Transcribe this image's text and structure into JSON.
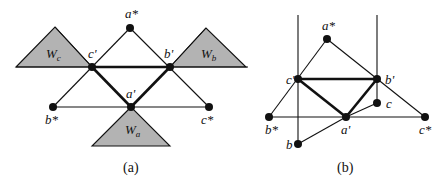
{
  "panel_a": {
    "caption": "(a)",
    "labels": {
      "a_star": "a*",
      "b_prime": "b'",
      "c_prime": "c'",
      "a_prime": "a'",
      "b_star": "b*",
      "c_star": "c*",
      "W_a": "W",
      "W_a_sub": "a",
      "W_b": "W",
      "W_b_sub": "b",
      "W_c": "W",
      "W_c_sub": "c"
    }
  },
  "panel_b": {
    "caption": "(b)",
    "labels": {
      "a_star": "a*",
      "b_prime": "b'",
      "c_prime": "c'",
      "a_prime": "a'",
      "b_star": "b*",
      "c_star": "c*",
      "b": "b",
      "c": "c"
    }
  },
  "colors": {
    "region_fill": "#b3b3b3",
    "line": "#111111",
    "background": "#ffffff"
  }
}
